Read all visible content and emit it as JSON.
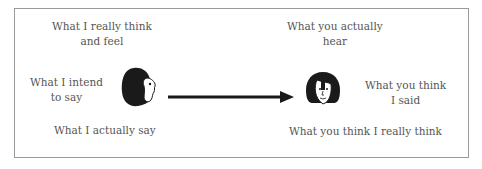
{
  "diagram": {
    "sender": {
      "think_feel": [
        "What I really think",
        "and feel"
      ],
      "intend": [
        "What I intend",
        "to say"
      ],
      "say": "What I actually say",
      "icon": "woman-profile-face-icon"
    },
    "receiver": {
      "hear": [
        "What you actually",
        "hear"
      ],
      "think_said": [
        "What you think",
        "I said"
      ],
      "think_think": "What you think I really think",
      "icon": "woman-front-face-icon"
    },
    "arrow": {
      "direction": "right",
      "color": "#1a1a1a"
    },
    "border_color": "#9a9a9a"
  }
}
